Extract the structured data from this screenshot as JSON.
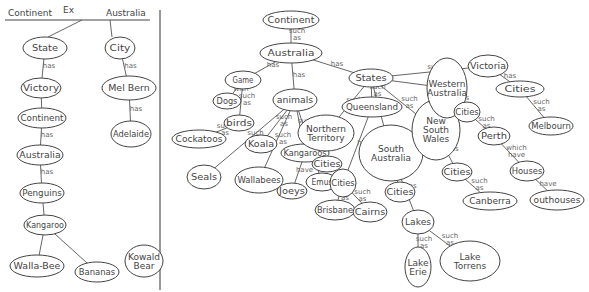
{
  "legend_panel": {
    "header_left": "Continent",
    "header_mid": "Ex",
    "header_right": "Australia",
    "nodes": [
      {
        "id": "l_state",
        "label": "State",
        "x": 45,
        "y": 48,
        "rx": 22,
        "ry": 11
      },
      {
        "id": "l_victory",
        "label": "Victory",
        "x": 41,
        "y": 88,
        "rx": 20,
        "ry": 10
      },
      {
        "id": "l_continent",
        "label": "Continent",
        "x": 42,
        "y": 118,
        "rx": 24,
        "ry": 10
      },
      {
        "id": "l_australia",
        "label": "Australia",
        "x": 40,
        "y": 155,
        "rx": 23,
        "ry": 10
      },
      {
        "id": "l_penguins",
        "label": "Penguins",
        "x": 42,
        "y": 193,
        "rx": 22,
        "ry": 10
      },
      {
        "id": "l_kangaroo",
        "label": "Kangaroo",
        "x": 45,
        "y": 225,
        "rx": 21,
        "ry": 10
      },
      {
        "id": "l_wallabee",
        "label": "Walla-Bee",
        "x": 37,
        "y": 266,
        "rx": 27,
        "ry": 11
      },
      {
        "id": "l_bananas",
        "label": "Bananas",
        "x": 97,
        "y": 272,
        "rx": 22,
        "ry": 10
      },
      {
        "id": "l_koala",
        "label": "Kowald Bear",
        "x": 144,
        "y": 261,
        "rx": 19,
        "ry": 16
      },
      {
        "id": "l_city",
        "label": "City",
        "x": 120,
        "y": 48,
        "rx": 15,
        "ry": 11
      },
      {
        "id": "l_melbourne",
        "label": "Mel Bern",
        "x": 129,
        "y": 88,
        "rx": 27,
        "ry": 12
      },
      {
        "id": "l_adelaide",
        "label": "Adelaide",
        "x": 131,
        "y": 134,
        "rx": 20,
        "ry": 13
      }
    ],
    "edges": [
      {
        "from": "l_state",
        "to": "l_victory",
        "label": "has"
      },
      {
        "from": "l_victory",
        "to": "l_continent",
        "label": ""
      },
      {
        "from": "l_continent",
        "to": "l_australia",
        "label": "has"
      },
      {
        "from": "l_australia",
        "to": "l_penguins",
        "label": "has"
      },
      {
        "from": "l_penguins",
        "to": "l_kangaroo",
        "label": ""
      },
      {
        "from": "l_kangaroo",
        "to": "l_wallabee",
        "label": ""
      },
      {
        "from": "l_kangaroo",
        "to": "l_bananas",
        "label": ""
      },
      {
        "from": "l_city",
        "to": "l_melbourne",
        "label": "has"
      },
      {
        "from": "l_melbourne",
        "to": "l_adelaide",
        "label": "has"
      }
    ]
  },
  "concept_map": {
    "nodes": [
      {
        "id": "continent",
        "label": "Continent",
        "x": 291,
        "y": 20,
        "rx": 28,
        "ry": 9
      },
      {
        "id": "australia",
        "label": "Australia",
        "x": 291,
        "y": 53,
        "rx": 31,
        "ry": 10
      },
      {
        "id": "game",
        "label": "Game",
        "x": 243,
        "y": 80,
        "rx": 18,
        "ry": 9
      },
      {
        "id": "dogs",
        "label": "Dogs",
        "x": 227,
        "y": 101,
        "rx": 14,
        "ry": 8
      },
      {
        "id": "birds",
        "label": "birds",
        "x": 239,
        "y": 123,
        "rx": 15,
        "ry": 8
      },
      {
        "id": "cockatoos",
        "label": "Cockatoos",
        "x": 199,
        "y": 139,
        "rx": 27,
        "ry": 9
      },
      {
        "id": "animals",
        "label": "animals",
        "x": 295,
        "y": 100,
        "rx": 22,
        "ry": 11
      },
      {
        "id": "koala",
        "label": "Koala",
        "x": 261,
        "y": 144,
        "rx": 16,
        "ry": 9
      },
      {
        "id": "kangaroos",
        "label": "Kangaroos",
        "x": 305,
        "y": 153,
        "rx": 24,
        "ry": 9
      },
      {
        "id": "seals",
        "label": "Seals",
        "x": 204,
        "y": 177,
        "rx": 17,
        "ry": 12
      },
      {
        "id": "wallabees",
        "label": "Wallabees",
        "x": 259,
        "y": 180,
        "rx": 24,
        "ry": 13
      },
      {
        "id": "joeys",
        "label": "Joeys",
        "x": 292,
        "y": 191,
        "rx": 15,
        "ry": 8
      },
      {
        "id": "emus",
        "label": "Emus",
        "x": 322,
        "y": 182,
        "rx": 16,
        "ry": 9
      },
      {
        "id": "states",
        "label": "States",
        "x": 371,
        "y": 78,
        "rx": 22,
        "ry": 9
      },
      {
        "id": "queensland",
        "label": "Queensland",
        "x": 372,
        "y": 107,
        "rx": 30,
        "ry": 10
      },
      {
        "id": "northern_territory",
        "label": "Northern Territory",
        "x": 326,
        "y": 133,
        "rx": 28,
        "ry": 18
      },
      {
        "id": "nt_cities",
        "label": "Cities",
        "x": 327,
        "y": 164,
        "rx": 15,
        "ry": 8
      },
      {
        "id": "south_australia",
        "label": "South Australia",
        "x": 391,
        "y": 153,
        "rx": 32,
        "ry": 28
      },
      {
        "id": "qld_cities",
        "label": "Cities",
        "x": 343,
        "y": 183,
        "rx": 13,
        "ry": 14
      },
      {
        "id": "brisbane",
        "label": "Brisbane",
        "x": 335,
        "y": 210,
        "rx": 20,
        "ry": 10
      },
      {
        "id": "cairns",
        "label": "Cairns",
        "x": 370,
        "y": 212,
        "rx": 17,
        "ry": 10
      },
      {
        "id": "sa_cities",
        "label": "Cities",
        "x": 400,
        "y": 192,
        "rx": 15,
        "ry": 10
      },
      {
        "id": "lakes",
        "label": "Lakes",
        "x": 418,
        "y": 222,
        "rx": 16,
        "ry": 12
      },
      {
        "id": "lake_erie",
        "label": "Lake Erie",
        "x": 418,
        "y": 267,
        "rx": 13,
        "ry": 20
      },
      {
        "id": "lake_torrens",
        "label": "Lake Torrens",
        "x": 470,
        "y": 261,
        "rx": 30,
        "ry": 20
      },
      {
        "id": "nsw",
        "label": "New South Wales",
        "x": 436,
        "y": 130,
        "rx": 24,
        "ry": 30
      },
      {
        "id": "western_australia",
        "label": "Western Australia",
        "x": 447,
        "y": 88,
        "rx": 20,
        "ry": 30
      },
      {
        "id": "wa_cities",
        "label": "Cities",
        "x": 467,
        "y": 112,
        "rx": 13,
        "ry": 10
      },
      {
        "id": "perth",
        "label": "Perth",
        "x": 494,
        "y": 136,
        "rx": 16,
        "ry": 9
      },
      {
        "id": "nsw_cities",
        "label": "Cities",
        "x": 457,
        "y": 172,
        "rx": 15,
        "ry": 9
      },
      {
        "id": "canberra",
        "label": "Canberra",
        "x": 490,
        "y": 201,
        "rx": 27,
        "ry": 9
      },
      {
        "id": "victoria",
        "label": "Victoria",
        "x": 488,
        "y": 66,
        "rx": 20,
        "ry": 11
      },
      {
        "id": "vic_cities",
        "label": "Cities",
        "x": 520,
        "y": 89,
        "rx": 24,
        "ry": 8
      },
      {
        "id": "melbourne",
        "label": "Melbourn",
        "x": 551,
        "y": 126,
        "rx": 22,
        "ry": 9
      },
      {
        "id": "houses",
        "label": "Houses",
        "x": 527,
        "y": 171,
        "rx": 17,
        "ry": 10
      },
      {
        "id": "outhouses",
        "label": "outhouses",
        "x": 557,
        "y": 200,
        "rx": 27,
        "ry": 10
      }
    ],
    "edges": [
      {
        "from": "continent",
        "to": "australia",
        "label": "such as"
      },
      {
        "from": "australia",
        "to": "game",
        "label": "has"
      },
      {
        "from": "game",
        "to": "dogs",
        "label": "with"
      },
      {
        "from": "game",
        "to": "birds",
        "label": "such as"
      },
      {
        "from": "birds",
        "to": "cockatoos",
        "label": "such as"
      },
      {
        "from": "australia",
        "to": "animals",
        "label": "has"
      },
      {
        "from": "animals",
        "to": "koala",
        "label": "such as"
      },
      {
        "from": "animals",
        "to": "kangaroos",
        "label": "such as"
      },
      {
        "from": "animals",
        "to": "seals",
        "label": "such as"
      },
      {
        "from": "animals",
        "to": "wallabees",
        "label": "such as"
      },
      {
        "from": "animals",
        "to": "emus",
        "label": "such as"
      },
      {
        "from": "kangaroos",
        "to": "joeys",
        "label": "have"
      },
      {
        "from": "australia",
        "to": "states",
        "label": "has"
      },
      {
        "from": "states",
        "to": "queensland",
        "label": "such as"
      },
      {
        "from": "states",
        "to": "northern_territory",
        "label": "such as"
      },
      {
        "from": "states",
        "to": "south_australia",
        "label": ""
      },
      {
        "from": "states",
        "to": "nsw",
        "label": "such as"
      },
      {
        "from": "states",
        "to": "western_australia",
        "label": ""
      },
      {
        "from": "states",
        "to": "victoria",
        "label": "such as"
      },
      {
        "from": "northern_territory",
        "to": "nt_cities",
        "label": "has"
      },
      {
        "from": "queensland",
        "to": "qld_cities",
        "label": "has"
      },
      {
        "from": "qld_cities",
        "to": "brisbane",
        "label": "such as"
      },
      {
        "from": "qld_cities",
        "to": "cairns",
        "label": "such as"
      },
      {
        "from": "south_australia",
        "to": "sa_cities",
        "label": "has"
      },
      {
        "from": "south_australia",
        "to": "lakes",
        "label": "has"
      },
      {
        "from": "lakes",
        "to": "lake_erie",
        "label": "such as"
      },
      {
        "from": "lakes",
        "to": "lake_torrens",
        "label": "such as"
      },
      {
        "from": "western_australia",
        "to": "wa_cities",
        "label": "has"
      },
      {
        "from": "wa_cities",
        "to": "perth",
        "label": "such as"
      },
      {
        "from": "perth",
        "to": "houses",
        "label": "which have"
      },
      {
        "from": "houses",
        "to": "outhouses",
        "label": "have"
      },
      {
        "from": "nsw",
        "to": "nsw_cities",
        "label": "has"
      },
      {
        "from": "nsw_cities",
        "to": "canberra",
        "label": "such as"
      },
      {
        "from": "victoria",
        "to": "vic_cities",
        "label": "has"
      },
      {
        "from": "vic_cities",
        "to": "melbourne",
        "label": "such as"
      }
    ]
  },
  "divider": {
    "x": 160
  },
  "colors": {
    "stroke": "#444444",
    "label": "#666666",
    "background": "#ffffff"
  }
}
